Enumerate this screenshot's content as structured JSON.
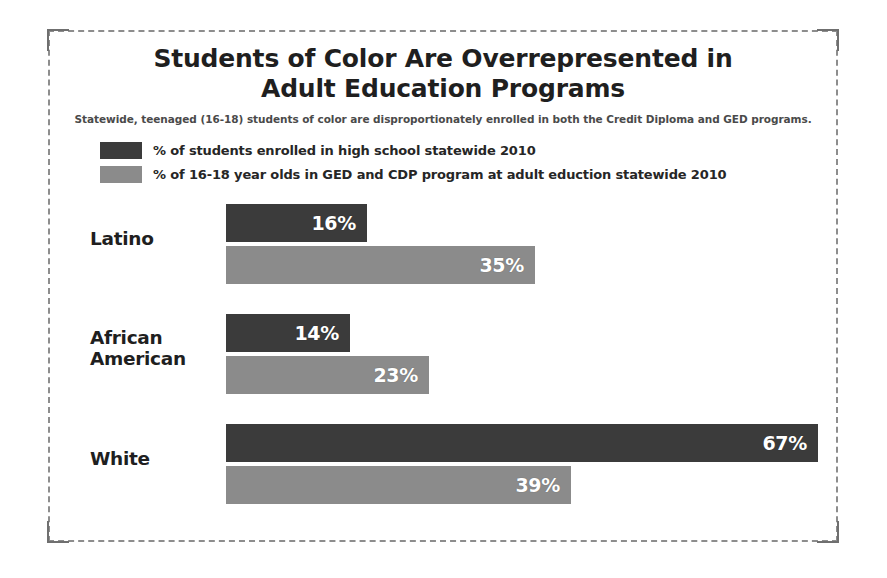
{
  "header": {
    "title_line1": "Students of Color Are Overrepresented in",
    "title_line2": "Adult Education Programs",
    "subtitle": "Statewide, teenaged (16-18) students of color are disproportionately enrolled in both the Credit Diploma and GED programs."
  },
  "legend": [
    {
      "label": "% of students enrolled in high school statewide 2010",
      "color": "#3b3b3b",
      "swatch_name": "legend-swatch-highschool"
    },
    {
      "label": "% of 16-18 year olds in GED and CDP program at adult eduction statewide 2010",
      "color": "#8b8b8b",
      "swatch_name": "legend-swatch-adulted"
    }
  ],
  "groups": [
    {
      "label_line1": "Latino",
      "label_line2": "",
      "bars": [
        {
          "value_label": "16%",
          "value": 16,
          "series": "high_school"
        },
        {
          "value_label": "35%",
          "value": 35,
          "series": "adult_ed"
        }
      ]
    },
    {
      "label_line1": "African",
      "label_line2": "American",
      "bars": [
        {
          "value_label": "14%",
          "value": 14,
          "series": "high_school"
        },
        {
          "value_label": "23%",
          "value": 23,
          "series": "adult_ed"
        }
      ]
    },
    {
      "label_line1": "White",
      "label_line2": "",
      "bars": [
        {
          "value_label": "67%",
          "value": 67,
          "series": "high_school"
        },
        {
          "value_label": "39%",
          "value": 39,
          "series": "adult_ed"
        }
      ]
    }
  ],
  "chart_data": {
    "type": "bar",
    "orientation": "horizontal",
    "title": "Students of Color Are Overrepresented in Adult Education Programs",
    "subtitle": "Statewide, teenaged (16-18) students of color are disproportionately enrolled in both the Credit Diploma and GED programs.",
    "categories": [
      "Latino",
      "African American",
      "White"
    ],
    "series": [
      {
        "name": "% of students enrolled in high school statewide 2010",
        "color": "#3b3b3b",
        "values": [
          16,
          14,
          67
        ]
      },
      {
        "name": "% of 16-18 year olds in GED and CDP program at adult eduction statewide 2010",
        "color": "#8b8b8b",
        "values": [
          35,
          23,
          39
        ]
      }
    ],
    "value_labels": [
      [
        "16%",
        "14%",
        "67%"
      ],
      [
        "35%",
        "23%",
        "39%"
      ]
    ],
    "xlabel": "",
    "ylabel": "",
    "xlim": [
      0,
      67
    ],
    "unit": "percent",
    "grid": false,
    "legend_position": "top-left",
    "axis_ticks_visible": false
  },
  "layout": {
    "px_per_percent": 8.84,
    "bar_origin_x": 178,
    "bar_height": 38
  }
}
